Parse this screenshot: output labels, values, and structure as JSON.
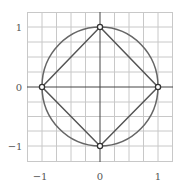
{
  "diagram": {
    "title": "",
    "x_ticks": [
      "−1",
      "0",
      "1"
    ],
    "y_ticks": [
      "1",
      "0",
      "−1"
    ],
    "xlim": [
      -1.25,
      1.25
    ],
    "ylim": [
      -1.25,
      1.25
    ],
    "grid_step": 0.25,
    "points": [
      {
        "label": "top",
        "x": 0,
        "y": 1
      },
      {
        "label": "right",
        "x": 1,
        "y": 0
      },
      {
        "label": "bottom",
        "x": 0,
        "y": -1
      },
      {
        "label": "left",
        "x": -1,
        "y": 0
      }
    ],
    "colors": {
      "grid": "#c8c8c8",
      "axes": "#444444",
      "circle": "#666666",
      "square": "#555555",
      "marker_fill": "#ffffff",
      "marker_stroke": "#333333"
    }
  }
}
